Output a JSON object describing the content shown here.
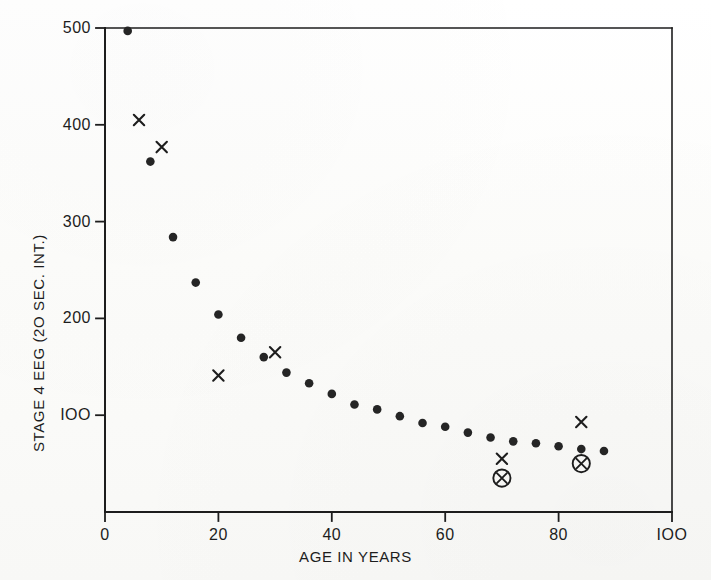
{
  "figure": {
    "background_color": "#fdfdfc",
    "ink_color": "#1d1d1d"
  },
  "chart_data": {
    "type": "scatter",
    "title": "",
    "subtitle": "",
    "xlabel": "AGE  IN  YEARS",
    "ylabel": "STAGE 4 EEG (2O SEC. INT.)",
    "xlim": [
      0,
      100
    ],
    "ylim": [
      0,
      500
    ],
    "xticks": [
      0,
      20,
      40,
      60,
      80,
      100
    ],
    "xticklabels": [
      "0",
      "20",
      "40",
      "60",
      "80",
      "IOO"
    ],
    "yticks": [
      100,
      200,
      300,
      400,
      500
    ],
    "yticklabels": [
      "IOO",
      "200",
      "300",
      "400",
      "500"
    ],
    "grid": false,
    "legend": null,
    "frame": "box",
    "series": [
      {
        "name": "mean stage 4 EEG",
        "marker": "filled-circle",
        "color": "#252525",
        "points": [
          {
            "x": 4,
            "y": 497
          },
          {
            "x": 8,
            "y": 362
          },
          {
            "x": 12,
            "y": 284
          },
          {
            "x": 16,
            "y": 237
          },
          {
            "x": 20,
            "y": 204
          },
          {
            "x": 24,
            "y": 180
          },
          {
            "x": 28,
            "y": 160
          },
          {
            "x": 32,
            "y": 144
          },
          {
            "x": 36,
            "y": 133
          },
          {
            "x": 40,
            "y": 122
          },
          {
            "x": 44,
            "y": 111
          },
          {
            "x": 48,
            "y": 106
          },
          {
            "x": 52,
            "y": 99
          },
          {
            "x": 56,
            "y": 92
          },
          {
            "x": 60,
            "y": 88
          },
          {
            "x": 64,
            "y": 82
          },
          {
            "x": 68,
            "y": 77
          },
          {
            "x": 72,
            "y": 73
          },
          {
            "x": 76,
            "y": 71
          },
          {
            "x": 80,
            "y": 68
          },
          {
            "x": 84,
            "y": 65
          },
          {
            "x": 88,
            "y": 63
          }
        ]
      },
      {
        "name": "individual x observations",
        "marker": "cross",
        "color": "#1d1d1d",
        "points": [
          {
            "x": 6,
            "y": 405
          },
          {
            "x": 10,
            "y": 377
          },
          {
            "x": 20,
            "y": 141
          },
          {
            "x": 30,
            "y": 165
          },
          {
            "x": 70,
            "y": 55
          },
          {
            "x": 84,
            "y": 93
          }
        ]
      },
      {
        "name": "circled observations",
        "marker": "circled-cross",
        "color": "#1d1d1d",
        "points": [
          {
            "x": 70,
            "y": 35
          },
          {
            "x": 84,
            "y": 50
          }
        ]
      }
    ]
  }
}
